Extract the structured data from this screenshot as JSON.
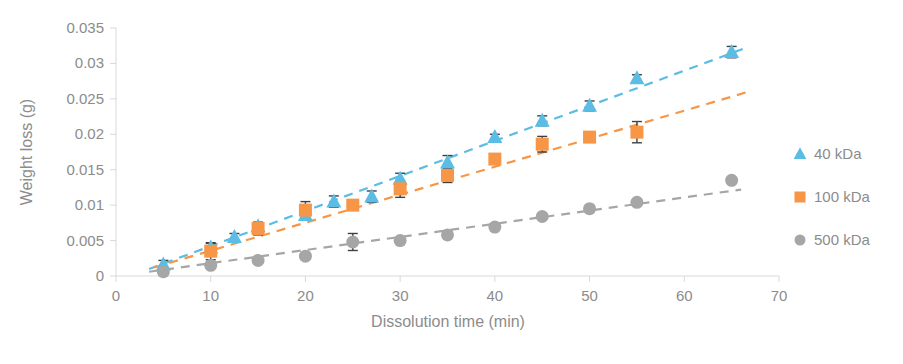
{
  "chart_data": {
    "type": "scatter",
    "title": "",
    "xlabel": "Dissolution time (min)",
    "ylabel": "Weight loss (g)",
    "xlim": [
      0,
      70
    ],
    "ylim": [
      0,
      0.035
    ],
    "xticks": [
      "0",
      "10",
      "20",
      "30",
      "40",
      "50",
      "60",
      "70"
    ],
    "xtick_values": [
      0,
      10,
      20,
      30,
      40,
      50,
      60,
      70
    ],
    "yticks": [
      "0",
      "0.005",
      "0.01",
      "0.015",
      "0.02",
      "0.025",
      "0.03",
      "0.035"
    ],
    "ytick_values": [
      0,
      0.005,
      0.01,
      0.015,
      0.02,
      0.025,
      0.03,
      0.035
    ],
    "grid": false,
    "legend_position": "right",
    "colors": {
      "series_40kda": "#5BBCE4",
      "series_100kda": "#F79646",
      "series_500kda": "#A6A6A6",
      "errorbar": "#404040",
      "axis": "#d9d9d9",
      "text": "#8c8c8c"
    },
    "series": [
      {
        "name": "40 kDa",
        "marker": "triangle",
        "color": "#5BBCE4",
        "x": [
          5,
          10,
          12.5,
          15,
          20,
          23,
          27,
          30,
          35,
          40,
          45,
          50,
          55,
          65
        ],
        "values": [
          0.0016,
          0.004,
          0.0055,
          0.007,
          0.0086,
          0.0105,
          0.0112,
          0.0137,
          0.016,
          0.0196,
          0.0219,
          0.024,
          0.0279,
          0.0316
        ],
        "yerr": [
          0.0006,
          0.0006,
          0.0005,
          0.0004,
          0.0004,
          0.0008,
          0.0008,
          0.0008,
          0.001,
          0.0004,
          0.0007,
          0.0007,
          0.0005,
          0.0008
        ],
        "trend": {
          "x0": 3.5,
          "y0": 0.001,
          "x1": 66.5,
          "y1": 0.0322
        }
      },
      {
        "name": "100 kDa",
        "marker": "square",
        "color": "#F79646",
        "x": [
          10,
          15,
          20,
          25,
          30,
          35,
          40,
          45,
          50,
          55
        ],
        "values": [
          0.0035,
          0.0067,
          0.0093,
          0.01,
          0.0123,
          0.0142,
          0.0165,
          0.0186,
          0.0196,
          0.0203
        ],
        "yerr": [
          0.0012,
          0.0009,
          0.0012,
          0.0006,
          0.0012,
          0.001,
          0.0004,
          0.0011,
          0.0007,
          0.0015
        ],
        "trend": {
          "x0": 4.0,
          "y0": 0.0012,
          "x1": 66.5,
          "y1": 0.0259
        }
      },
      {
        "name": "500 kDa",
        "marker": "circle",
        "color": "#A6A6A6",
        "x": [
          5,
          10,
          15,
          20,
          25,
          30,
          35,
          40,
          45,
          50,
          55,
          65
        ],
        "values": [
          0.0006,
          0.0015,
          0.0022,
          0.0028,
          0.0048,
          0.005,
          0.0058,
          0.0069,
          0.0084,
          0.0095,
          0.0104,
          0.0135
        ],
        "yerr": [
          0.0004,
          0.0004,
          0.0003,
          0.0004,
          0.0012,
          0.0004,
          0.0004,
          0.0004,
          0.0004,
          0.0004,
          0.0004,
          0.0004
        ],
        "trend": {
          "x0": 3.5,
          "y0": 0.0006,
          "x1": 66.0,
          "y1": 0.0122
        }
      }
    ],
    "legend": [
      {
        "label": "40 kDa",
        "marker": "triangle",
        "color": "#5BBCE4"
      },
      {
        "label": "100 kDa",
        "marker": "square",
        "color": "#F79646"
      },
      {
        "label": "500 kDa",
        "marker": "circle",
        "color": "#A6A6A6"
      }
    ]
  }
}
